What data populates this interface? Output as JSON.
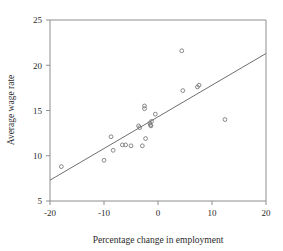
{
  "chart_data": {
    "type": "scatter",
    "title": "",
    "xlabel": "Percentage change in employment",
    "ylabel": "Average wage rate",
    "xlim": [
      -20,
      20
    ],
    "ylim": [
      5,
      25
    ],
    "xticks": [
      -20,
      -10,
      0,
      10,
      20
    ],
    "yticks": [
      5,
      10,
      15,
      20,
      25
    ],
    "xtick_labels": [
      "-20",
      "-10",
      "0",
      "10",
      "20"
    ],
    "ytick_labels": [
      "5",
      "10",
      "15",
      "20",
      "25"
    ],
    "grid": false,
    "legend": null,
    "marker": "open-circle",
    "marker_color": "#7a7a7a",
    "points": [
      {
        "x": -17.9,
        "y": 8.8
      },
      {
        "x": -10.0,
        "y": 9.5
      },
      {
        "x": -8.7,
        "y": 12.1
      },
      {
        "x": -8.3,
        "y": 10.6
      },
      {
        "x": -6.6,
        "y": 11.2
      },
      {
        "x": -6.0,
        "y": 11.2
      },
      {
        "x": -5.0,
        "y": 11.1
      },
      {
        "x": -3.6,
        "y": 13.3
      },
      {
        "x": -3.4,
        "y": 13.1
      },
      {
        "x": -2.9,
        "y": 11.1
      },
      {
        "x": -2.5,
        "y": 15.5
      },
      {
        "x": -2.5,
        "y": 15.2
      },
      {
        "x": -2.3,
        "y": 11.9
      },
      {
        "x": -1.5,
        "y": 13.6
      },
      {
        "x": -1.4,
        "y": 13.4
      },
      {
        "x": -1.3,
        "y": 13.3
      },
      {
        "x": -1.2,
        "y": 13.8
      },
      {
        "x": -0.5,
        "y": 14.6
      },
      {
        "x": 4.4,
        "y": 21.6
      },
      {
        "x": 4.6,
        "y": 17.2
      },
      {
        "x": 7.3,
        "y": 17.6
      },
      {
        "x": 7.6,
        "y": 17.8
      },
      {
        "x": 12.4,
        "y": 14.0
      }
    ],
    "fit_line": {
      "type": "linear",
      "x_start": -20,
      "y_start": 7.3,
      "x_end": 20,
      "y_end": 21.3,
      "color": "#6f6f6f"
    }
  }
}
